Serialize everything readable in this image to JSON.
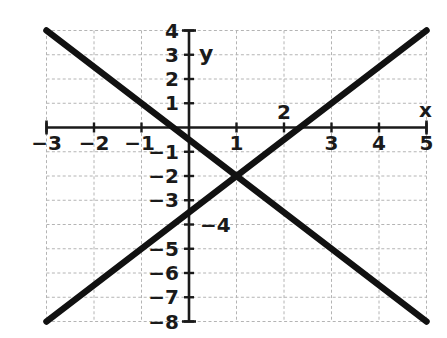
{
  "figure": {
    "title": "",
    "background_color": "#ffffff",
    "line_color": "#111111",
    "axis_color": "#1a1a1a",
    "grid_color": "#b4b4b4"
  },
  "axes": {
    "x_axis_label": "x",
    "y_axis_label": "y",
    "x_ticks": [
      {
        "value": -3,
        "label": "−3"
      },
      {
        "value": -2,
        "label": "−2"
      },
      {
        "value": -1,
        "label": "−1"
      },
      {
        "value": 1,
        "label": "1"
      },
      {
        "value": 2,
        "label": "2"
      },
      {
        "value": 3,
        "label": "3"
      },
      {
        "value": 4,
        "label": "4"
      },
      {
        "value": 5,
        "label": "5"
      }
    ],
    "y_ticks": [
      {
        "value": 4,
        "label": "4"
      },
      {
        "value": 3,
        "label": "3"
      },
      {
        "value": 2,
        "label": "2"
      },
      {
        "value": 1,
        "label": "1"
      },
      {
        "value": -1,
        "label": "−1"
      },
      {
        "value": -2,
        "label": "−2"
      },
      {
        "value": -3,
        "label": "−3"
      },
      {
        "value": -4,
        "label": "−4"
      },
      {
        "value": -5,
        "label": "−5"
      },
      {
        "value": -6,
        "label": "−6"
      },
      {
        "value": -7,
        "label": "−7"
      },
      {
        "value": -8,
        "label": "−8"
      }
    ]
  },
  "chart_data": {
    "type": "line",
    "title": "",
    "xlabel": "x",
    "ylabel": "y",
    "xlim": [
      -3,
      5
    ],
    "ylim": [
      -8,
      4
    ],
    "xticks": [
      -3,
      -2,
      -1,
      0,
      1,
      2,
      3,
      4,
      5
    ],
    "yticks": [
      -8,
      -7,
      -6,
      -5,
      -4,
      -3,
      -2,
      -1,
      0,
      1,
      2,
      3,
      4
    ],
    "grid": true,
    "grid_style": "dashed",
    "legend": false,
    "series": [
      {
        "name": "descending-line",
        "x": [
          -3,
          5
        ],
        "y": [
          4,
          -8
        ],
        "slope": -1.5,
        "intercept": -0.5,
        "color": "#111111"
      },
      {
        "name": "ascending-line",
        "x": [
          -3,
          5
        ],
        "y": [
          -8,
          4
        ],
        "slope": 1.5,
        "intercept": -3.5,
        "color": "#111111"
      }
    ],
    "annotations": [
      {
        "name": "intersection",
        "x": 1,
        "y": -2,
        "label": ""
      }
    ]
  }
}
